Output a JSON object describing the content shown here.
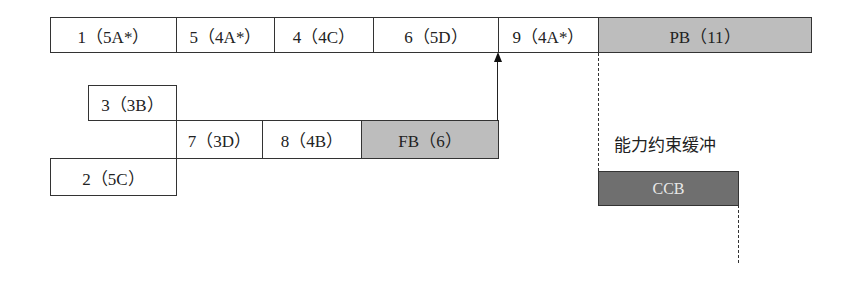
{
  "diagram": {
    "top_row": [
      {
        "id": "task-1",
        "label": "1（5A*）"
      },
      {
        "id": "task-5",
        "label": "5（4A*）"
      },
      {
        "id": "task-4",
        "label": "4（4C）"
      },
      {
        "id": "task-6",
        "label": "6（5D）"
      },
      {
        "id": "task-9",
        "label": "9（4A*）"
      },
      {
        "id": "project-buffer",
        "label": "PB（11）"
      }
    ],
    "feeding_chain_1": {
      "id": "task-3",
      "label": "3（3B）"
    },
    "feeding_chain_2": [
      {
        "id": "task-7",
        "label": "7（3D）"
      },
      {
        "id": "task-8",
        "label": "8（4B）"
      },
      {
        "id": "feeding-buffer",
        "label": "FB（6）"
      }
    ],
    "feeding_chain_3": {
      "id": "task-2",
      "label": "2（5C）"
    },
    "capacity_buffer": {
      "title": "能力约束缓冲",
      "label": "CCB"
    },
    "colors": {
      "buffer_gray": "#bdbdbd",
      "ccb_dark": "#6f6f6f",
      "border": "#333333"
    }
  }
}
